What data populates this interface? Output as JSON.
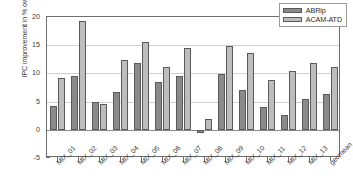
{
  "chart_data": {
    "type": "bar",
    "title": "",
    "xlabel": "",
    "ylabel": "IPC improvement in % over SRRIP",
    "ylim": [
      -5,
      20
    ],
    "yticks": [
      -5,
      0,
      5,
      10,
      15,
      20
    ],
    "ytick_labels": [
      "-5",
      "0",
      "5",
      "10",
      "15",
      "20"
    ],
    "grid": true,
    "legend_position": "top-right",
    "categories": [
      "MIX_01",
      "MIX_02",
      "MIX_03",
      "MIX_04",
      "MIX_05",
      "MIX_06",
      "MIX_07",
      "MIX_08",
      "MIX_09",
      "MIX_10",
      "MIX_11",
      "MIX_12",
      "MIX_13",
      "geomean"
    ],
    "series": [
      {
        "name": "ABRip",
        "color": "#8a8a8a",
        "values": [
          4.2,
          9.6,
          5.0,
          6.7,
          11.9,
          8.5,
          9.5,
          -0.6,
          9.9,
          7.0,
          4.0,
          2.7,
          5.4,
          6.3
        ]
      },
      {
        "name": "ACAM-ATD",
        "color": "#bdbdbd",
        "values": [
          9.2,
          19.3,
          4.6,
          12.3,
          15.6,
          11.1,
          14.5,
          2.0,
          14.9,
          13.7,
          8.8,
          10.5,
          11.9,
          11.2
        ]
      }
    ]
  },
  "legend": {
    "items": [
      {
        "label": "ABRip"
      },
      {
        "label": "ACAM-ATD"
      }
    ]
  }
}
